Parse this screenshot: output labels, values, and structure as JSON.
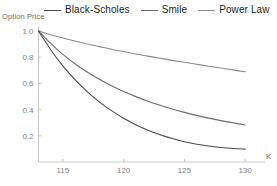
{
  "legend": {
    "entries": [
      {
        "label": "Black-Scholes",
        "color": "#4a4a4a",
        "icon": "line-swatch-icon"
      },
      {
        "label": "Smile",
        "color": "#6b6b6b",
        "icon": "line-swatch-icon"
      },
      {
        "label": "Power Law",
        "color": "#8a8a8a",
        "icon": "line-swatch-icon"
      }
    ]
  },
  "axes": {
    "ylabel": "Option Price",
    "xlabel": "K",
    "yticks": [
      "1.0",
      "0.8",
      "0.6",
      "0.4",
      "0.2"
    ],
    "xticks": [
      "115",
      "120",
      "125",
      "130"
    ]
  },
  "chart_data": {
    "type": "line",
    "title": "",
    "xlabel": "K",
    "ylabel": "Option Price",
    "xlim": [
      113,
      130.8
    ],
    "ylim": [
      0,
      1.05
    ],
    "yticks": [
      1.0,
      0.8,
      0.6,
      0.4,
      0.2
    ],
    "xticks": [
      115,
      120,
      125,
      130
    ],
    "grid": false,
    "legend_position": "top",
    "x": [
      113,
      114,
      115,
      116,
      117,
      118,
      119,
      120,
      121,
      122,
      123,
      124,
      125,
      126,
      127,
      128,
      129,
      130
    ],
    "series": [
      {
        "name": "Power Law",
        "color": "#8a8a8a",
        "values": [
          1.0,
          0.972,
          0.947,
          0.923,
          0.901,
          0.881,
          0.861,
          0.843,
          0.825,
          0.808,
          0.792,
          0.776,
          0.761,
          0.746,
          0.731,
          0.717,
          0.703,
          0.689
        ]
      },
      {
        "name": "Smile",
        "color": "#6b6b6b",
        "values": [
          1.0,
          0.905,
          0.822,
          0.75,
          0.687,
          0.631,
          0.582,
          0.538,
          0.499,
          0.464,
          0.433,
          0.405,
          0.379,
          0.356,
          0.335,
          0.316,
          0.299,
          0.283
        ]
      },
      {
        "name": "Black-Scholes",
        "color": "#4a4a4a",
        "values": [
          1.0,
          0.857,
          0.734,
          0.628,
          0.537,
          0.459,
          0.392,
          0.334,
          0.285,
          0.243,
          0.208,
          0.179,
          0.155,
          0.136,
          0.122,
          0.111,
          0.103,
          0.098
        ]
      }
    ]
  }
}
